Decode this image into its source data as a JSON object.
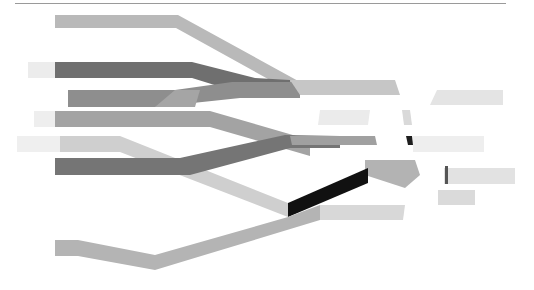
{
  "diagram": {
    "type": "abstract-flow-bands",
    "background": "#ffffff",
    "top_rule_color": "#9a9a9a",
    "bands": [
      {
        "id": "b1",
        "fill": "#b9b9b9",
        "points": "55,15 178,15 300,82 288,90 176,28 55,28"
      },
      {
        "id": "b2-fade",
        "fill": "#ececec",
        "points": "28,62 55,62 55,78 28,78"
      },
      {
        "id": "b2",
        "fill": "#6f6f6f",
        "points": "55,62 192,62 255,78 290,80 290,96 250,96 192,78 55,78"
      },
      {
        "id": "b3",
        "fill": "#8e8e8e",
        "points": "68,90 175,90 232,82 300,82 300,98 240,98 155,107 68,107"
      },
      {
        "id": "b3b",
        "fill": "#a5a5a5",
        "points": "155,107 175,90 200,90 195,107"
      },
      {
        "id": "b4-fade",
        "fill": "#eeeeee",
        "points": "34,111 55,111 55,127 34,127"
      },
      {
        "id": "b4",
        "fill": "#a3a3a3",
        "points": "55,111 210,111 310,140 310,156 210,127 55,127"
      },
      {
        "id": "b5-fade",
        "fill": "#efefef",
        "points": "17,136 60,136 60,152 17,152"
      },
      {
        "id": "b5",
        "fill": "#cfcfcf",
        "points": "60,136 120,136 288,203 288,217 120,152 60,152"
      },
      {
        "id": "b6",
        "fill": "#757575",
        "points": "55,158 180,158 285,135 340,136 340,148 290,148 190,175 55,175"
      },
      {
        "id": "b7",
        "fill": "#c6c6c6",
        "points": "290,80 395,80 400,95 300,95"
      },
      {
        "id": "b8",
        "fill": "#ebebeb",
        "points": "320,110 370,110 368,125 318,125"
      },
      {
        "id": "b9",
        "fill": "#a0a0a0",
        "points": "290,136 375,136 377,145 292,145"
      },
      {
        "id": "b10",
        "fill": "#b3b3b3",
        "points": "365,160 415,160 420,175 405,188 365,175"
      },
      {
        "id": "b11-dark",
        "fill": "#111111",
        "points": "288,203 368,168 368,183 288,217"
      },
      {
        "id": "b12",
        "fill": "#b4b4b4",
        "points": "55,240 78,240 155,255 288,217 320,205 320,220 155,270 78,256 55,256"
      },
      {
        "id": "b13",
        "fill": "#d8d8d8",
        "points": "320,205 405,205 403,220 320,220"
      },
      {
        "id": "b14",
        "fill": "#e4e4e4",
        "points": "437,90 503,90 503,105 430,105"
      },
      {
        "id": "b15",
        "fill": "#d9d9d9",
        "points": "402,110 410,110 412,125 404,125"
      },
      {
        "id": "b16-dark",
        "fill": "#1e1e1e",
        "points": "406,136 412,136 413,145 408,145"
      },
      {
        "id": "b16",
        "fill": "#eeeeee",
        "points": "413,136 484,136 484,152 413,152"
      },
      {
        "id": "b17",
        "fill": "#e2e2e2",
        "points": "444,168 515,168 515,184 444,184"
      },
      {
        "id": "b17-dark",
        "fill": "#555555",
        "points": "445,166 448,166 448,184 445,184"
      },
      {
        "id": "b18",
        "fill": "#dadada",
        "points": "438,190 475,190 475,205 438,205"
      }
    ]
  }
}
